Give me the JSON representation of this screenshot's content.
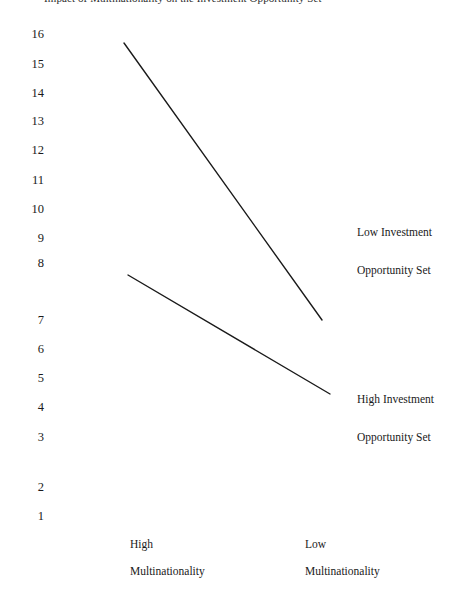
{
  "title": {
    "text": "Impact of Multinationality on the Investment Opportunity Set",
    "clipped": true
  },
  "axis": {
    "y_ticks": [
      {
        "label": "16",
        "y": 34
      },
      {
        "label": "15",
        "y": 64
      },
      {
        "label": "14",
        "y": 93
      },
      {
        "label": "13",
        "y": 121
      },
      {
        "label": "12",
        "y": 150
      },
      {
        "label": "11",
        "y": 180
      },
      {
        "label": "10",
        "y": 209
      },
      {
        "label": "9",
        "y": 238
      },
      {
        "label": "8",
        "y": 263
      },
      {
        "label": "7",
        "y": 320
      },
      {
        "label": "6",
        "y": 349
      },
      {
        "label": "5",
        "y": 378
      },
      {
        "label": "4",
        "y": 407
      },
      {
        "label": "3",
        "y": 437
      },
      {
        "label": "2",
        "y": 487
      },
      {
        "label": "1",
        "y": 516
      }
    ],
    "x_categories": [
      {
        "line1": "High",
        "line2": "Multinationality",
        "x": 130
      },
      {
        "line1": "Low",
        "line2": "Multinationality",
        "x": 305
      }
    ]
  },
  "series_labels": [
    {
      "line1": "Low Investment",
      "line2": "Opportunity Set",
      "x": 357,
      "y1": 232,
      "y2": 270
    },
    {
      "line1": "High Investment",
      "line2": "Opportunity Set",
      "x": 357,
      "y1": 399,
      "y2": 437
    }
  ],
  "style": {
    "line_color": "#1a1a1a",
    "line_width": 1.4,
    "background": "#ffffff"
  },
  "chart_data": {
    "type": "line",
    "title": "Impact of Multinationality on the Investment Opportunity Set",
    "xlabel": "",
    "ylabel": "",
    "grid": false,
    "legend": "right-inline",
    "categories": [
      "High Multinationality",
      "Low Multinationality"
    ],
    "x_pixels": [
      124,
      322
    ],
    "ylim": [
      1,
      16
    ],
    "yticks": [
      1,
      2,
      3,
      4,
      5,
      6,
      7,
      8,
      9,
      10,
      11,
      12,
      13,
      14,
      15,
      16
    ],
    "series": [
      {
        "name": "Low Investment Opportunity Set",
        "values": [
          15.6,
          7.0
        ],
        "points": [
          {
            "x": 124,
            "y": 43
          },
          {
            "x": 322,
            "y": 320
          }
        ]
      },
      {
        "name": "High Investment Opportunity Set",
        "values": [
          7.8,
          4.3
        ],
        "points": [
          {
            "x": 128,
            "y": 275
          },
          {
            "x": 330,
            "y": 394
          }
        ]
      }
    ]
  }
}
